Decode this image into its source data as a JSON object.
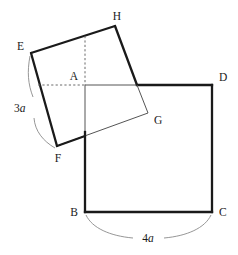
{
  "figure": {
    "background_color": "#ffffff",
    "stroke_color": "#1a1a1a",
    "thin_stroke_color": "#4a4a4a",
    "dash_stroke_color": "#6a6a6a",
    "labels": {
      "A": "A",
      "B": "B",
      "C": "C",
      "D": "D",
      "E": "E",
      "F": "F",
      "G": "G",
      "H": "H"
    },
    "measures": {
      "side_3a_number": "3",
      "side_3a_unit": "a",
      "side_4a_number": "4",
      "side_4a_unit": "a"
    },
    "shapes": {
      "square_abcd": {
        "name": "large-square-ABCD",
        "points": "85,85 212,85 212,212 85,212"
      },
      "square_efgh_tilted": {
        "name": "tilted-square-EFGH",
        "points": "31,53 115,26 148,113 57,146"
      }
    }
  }
}
